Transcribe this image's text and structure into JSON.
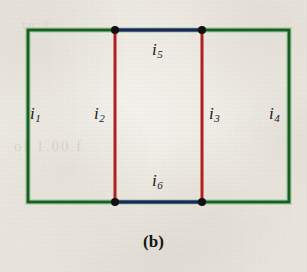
{
  "figure": {
    "caption": "(b)",
    "background_color": "#efece6"
  },
  "colors": {
    "outer_loop": "#16611f",
    "branch": "#b11f1f",
    "middle_link": "#1b2566",
    "node": "#111111",
    "label_text": "#1a1a1a"
  },
  "labels": {
    "i1": {
      "symbol": "i",
      "subscript": "1"
    },
    "i2": {
      "symbol": "i",
      "subscript": "2"
    },
    "i3": {
      "symbol": "i",
      "subscript": "3"
    },
    "i4": {
      "symbol": "i",
      "subscript": "4"
    },
    "i5": {
      "symbol": "i",
      "subscript": "5"
    },
    "i6": {
      "symbol": "i",
      "subscript": "6"
    }
  },
  "ghost": {
    "line1": "of 1.00 f",
    "line2": "to 2"
  },
  "geometry": {
    "outer_rect": {
      "x1": 28,
      "y1": 30,
      "x2": 289,
      "y2": 202
    },
    "branch_left_x": 115,
    "branch_right_x": 202,
    "nodes": [
      {
        "x": 115,
        "y": 30
      },
      {
        "x": 202,
        "y": 30
      },
      {
        "x": 115,
        "y": 202
      },
      {
        "x": 202,
        "y": 202
      }
    ],
    "stroke_width_outer": 3,
    "stroke_width_branch": 3,
    "stroke_width_link": 3,
    "node_radius": 4
  }
}
